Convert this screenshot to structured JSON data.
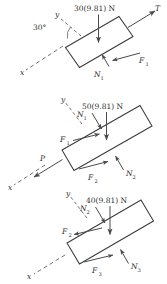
{
  "figure": {
    "kind": "free-body-diagram",
    "incline_angle_label": "30°",
    "stroke_color": "#3a3a3a",
    "arrow_color": "#4a4a4a",
    "axis_color": "#6a6a6a",
    "background": "#ffffff"
  },
  "blocks": [
    {
      "id": "block-top",
      "weight_label": "30(9.81) N",
      "weight_value": 30,
      "gravity": 9.81,
      "axis_x_label": "x",
      "axis_y_label": "y",
      "angle_label": "30°",
      "forces": [
        {
          "name": "T",
          "label": "T",
          "kind": "tension",
          "direction": "up-incline"
        },
        {
          "name": "N1",
          "label": "N",
          "sub": "1",
          "kind": "normal",
          "direction": "perpendicular-up"
        },
        {
          "name": "F1",
          "label": "F",
          "sub": "1",
          "kind": "friction",
          "direction": "down-incline"
        }
      ]
    },
    {
      "id": "block-middle",
      "weight_label": "50(9.81) N",
      "weight_value": 50,
      "gravity": 9.81,
      "axis_x_label": "x",
      "axis_y_label": "y",
      "forces": [
        {
          "name": "P",
          "label": "P",
          "kind": "applied",
          "direction": "down-incline"
        },
        {
          "name": "N1",
          "label": "N",
          "sub": "1",
          "kind": "normal-reaction",
          "direction": "perpendicular-down"
        },
        {
          "name": "F1",
          "label": "F",
          "sub": "1",
          "kind": "friction",
          "direction": "up-incline"
        },
        {
          "name": "N2",
          "label": "N",
          "sub": "2",
          "kind": "normal",
          "direction": "perpendicular-up"
        },
        {
          "name": "F2",
          "label": "F",
          "sub": "2",
          "kind": "friction",
          "direction": "up-incline"
        }
      ]
    },
    {
      "id": "block-bottom",
      "weight_label": "40(9.81) N",
      "weight_value": 40,
      "gravity": 9.81,
      "axis_x_label": "x",
      "axis_y_label": "y",
      "forces": [
        {
          "name": "N2",
          "label": "N",
          "sub": "2",
          "kind": "normal-reaction",
          "direction": "perpendicular-down"
        },
        {
          "name": "F2",
          "label": "F",
          "sub": "2",
          "kind": "friction",
          "direction": "down-incline"
        },
        {
          "name": "N3",
          "label": "N",
          "sub": "3",
          "kind": "normal",
          "direction": "perpendicular-up"
        },
        {
          "name": "F3",
          "label": "F",
          "sub": "3",
          "kind": "friction",
          "direction": "up-incline"
        }
      ]
    }
  ],
  "labels": {
    "x": "x",
    "y": "y",
    "angle": "30°",
    "T": "T",
    "P": "P",
    "N": "N",
    "F": "F",
    "one": "1",
    "two": "2",
    "three": "3",
    "w1": "30(9.81) N",
    "w2": "50(9.81) N",
    "w3": "40(9.81) N"
  }
}
